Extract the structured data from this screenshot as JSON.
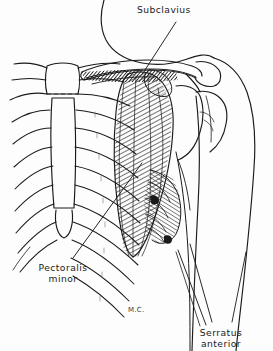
{
  "figure": {
    "medium": "pen-and-ink anatomical illustration",
    "background_color": "#fdfdfd",
    "ink_color": "#1a1a1a"
  },
  "labels": {
    "subclavius": "Subclavius",
    "pectoralis_minor_line1": "Pectoralis",
    "pectoralis_minor_line2": "minor",
    "serratus_anterior_line1": "Serratus",
    "serratus_anterior_line2": "anterior",
    "artist_initials": "M.C."
  },
  "anatomy": {
    "structures": [
      "clavicle",
      "subclavius muscle",
      "sternum (manubrium, body, xiphoid process)",
      "costal cartilages",
      "ribs",
      "scapula",
      "acromion",
      "coracoid process",
      "humerus head",
      "deltoid contour",
      "pectoralis minor muscle",
      "serratus anterior muscle",
      "neck contour",
      "arm contour"
    ]
  }
}
